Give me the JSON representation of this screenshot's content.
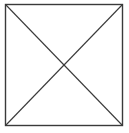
{
  "diagram": {
    "shape": "square-with-diagonals",
    "stroke_color": "#3a3a3a",
    "background_color": "#ffffff"
  }
}
